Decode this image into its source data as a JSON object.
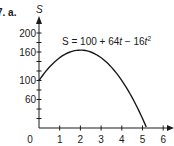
{
  "problem_label": "7. a.",
  "chart_data": {
    "type": "line",
    "title": "",
    "equation": "S = 100 + 64t − 16t²",
    "equation_parts": {
      "prefix": "S = 100 + 64",
      "t1": "t",
      "mid": " − 16",
      "t2": "t",
      "exp": "2"
    },
    "xlabel": "",
    "ylabel": "S",
    "xlim": [
      0,
      6
    ],
    "ylim": [
      0,
      200
    ],
    "x_ticks": [
      1,
      2,
      3,
      4,
      5,
      6
    ],
    "x_tick_labels": [
      "1",
      "2",
      "3",
      "4",
      "5",
      "6"
    ],
    "origin_label": "0",
    "y_ticks_minor_step": 20,
    "y_tick_labels": [
      "60",
      "100",
      "160",
      "200"
    ],
    "y_tick_label_values": [
      60,
      100,
      160,
      200
    ],
    "grid": false,
    "legend": "none",
    "series": [
      {
        "name": "S(t)",
        "x": [
          0,
          0.5,
          1,
          1.5,
          2,
          2.5,
          3,
          3.5,
          4,
          4.5,
          5,
          5.18
        ],
        "values": [
          100,
          128,
          148,
          160,
          164,
          160,
          148,
          128,
          100,
          64,
          20,
          0
        ]
      }
    ]
  }
}
